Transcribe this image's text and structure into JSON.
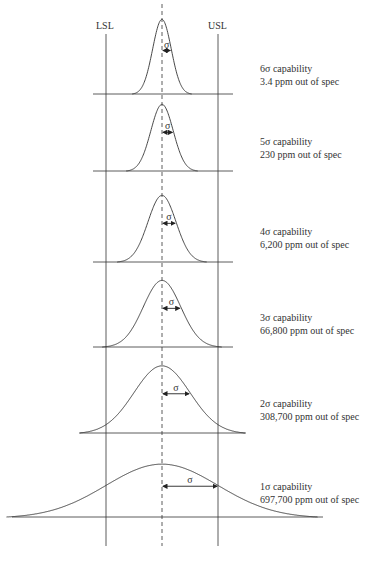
{
  "diagram": {
    "limits": {
      "lsl_label": "LSL",
      "usl_label": "USL"
    },
    "sigma_symbol": "σ",
    "panels": [
      {
        "capability": "6σ capability",
        "ppm": "3.4 ppm out of spec",
        "sigma_level": 6,
        "ppm_value": 3.4
      },
      {
        "capability": "5σ capability",
        "ppm": "230 ppm out of spec",
        "sigma_level": 5,
        "ppm_value": 230
      },
      {
        "capability": "4σ capability",
        "ppm": "6,200 ppm out of spec",
        "sigma_level": 4,
        "ppm_value": 6200
      },
      {
        "capability": "3σ capability",
        "ppm": "66,800 ppm out of spec",
        "sigma_level": 3,
        "ppm_value": 66800
      },
      {
        "capability": "2σ capability",
        "ppm": "308,700 ppm out of spec",
        "sigma_level": 2,
        "ppm_value": 308700
      },
      {
        "capability": "1σ capability",
        "ppm": "697,700 ppm out of spec",
        "sigma_level": 1,
        "ppm_value": 697700
      }
    ]
  }
}
